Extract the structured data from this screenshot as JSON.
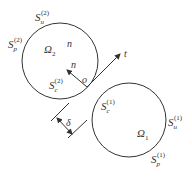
{
  "diagram": {
    "colors": {
      "stroke": "#333333",
      "background": "#ffffff"
    },
    "body2": {
      "domain_label": "Ω",
      "domain_sub": "2",
      "normal_label": "n",
      "contact_surface": {
        "base": "S",
        "sub": "c",
        "sup": "(2)"
      },
      "unloaded_surface": {
        "base": "S",
        "sub": "u",
        "sup": "(2)"
      },
      "prescribed_surface": {
        "base": "S",
        "sub": "p",
        "sup": "(2)"
      }
    },
    "body1": {
      "domain_label": "Ω",
      "domain_sub": "1",
      "contact_surface": {
        "base": "S",
        "sub": "c",
        "sup": "(1)"
      },
      "unloaded_surface": {
        "base": "S",
        "sub": "u",
        "sup": "(1)"
      },
      "prescribed_surface": {
        "base": "S",
        "sub": "p",
        "sup": "(1)"
      }
    },
    "contact": {
      "origin_label": "o",
      "normal_arrow_label": "n",
      "tangent_arrow_label": "t"
    },
    "gap": {
      "label": "δ"
    }
  }
}
